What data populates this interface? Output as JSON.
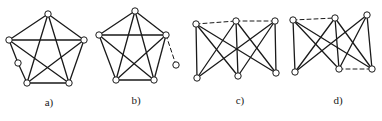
{
  "figure": {
    "colors": {
      "line": "#1a1a1a",
      "node_fill": "#ffffff",
      "background": "#ffffff"
    },
    "panels": [
      {
        "id": "a",
        "label": "a)",
        "label_pos": [
          49,
          104
        ],
        "nodes": [
          {
            "id": "top",
            "x": 48,
            "y": 14
          },
          {
            "id": "left",
            "x": 9,
            "y": 40
          },
          {
            "id": "right",
            "x": 84,
            "y": 40
          },
          {
            "id": "bottom-left",
            "x": 27,
            "y": 83
          },
          {
            "id": "bottom-right",
            "x": 69,
            "y": 83
          },
          {
            "id": "subdivision",
            "x": 18,
            "y": 63
          }
        ],
        "edges": [
          {
            "from": "top",
            "to": "left",
            "style": "solid"
          },
          {
            "from": "top",
            "to": "right",
            "style": "solid"
          },
          {
            "from": "top",
            "to": "bottom-left",
            "style": "solid"
          },
          {
            "from": "top",
            "to": "bottom-right",
            "style": "solid"
          },
          {
            "from": "left",
            "to": "right",
            "style": "solid"
          },
          {
            "from": "left",
            "to": "subdivision",
            "style": "solid"
          },
          {
            "from": "subdivision",
            "to": "bottom-left",
            "style": "solid"
          },
          {
            "from": "left",
            "to": "bottom-right",
            "style": "solid"
          },
          {
            "from": "right",
            "to": "bottom-left",
            "style": "solid"
          },
          {
            "from": "right",
            "to": "bottom-right",
            "style": "solid"
          },
          {
            "from": "bottom-left",
            "to": "bottom-right",
            "style": "solid"
          }
        ]
      },
      {
        "id": "b",
        "label": "b)",
        "label_pos": [
          136,
          102
        ],
        "nodes": [
          {
            "id": "top",
            "x": 135,
            "y": 11
          },
          {
            "id": "left",
            "x": 99,
            "y": 35
          },
          {
            "id": "right",
            "x": 166,
            "y": 35
          },
          {
            "id": "bottom-left",
            "x": 116,
            "y": 80
          },
          {
            "id": "bottom-right",
            "x": 154,
            "y": 80
          },
          {
            "id": "pendant",
            "x": 176,
            "y": 65
          }
        ],
        "edges": [
          {
            "from": "top",
            "to": "left",
            "style": "solid"
          },
          {
            "from": "top",
            "to": "right",
            "style": "solid"
          },
          {
            "from": "top",
            "to": "bottom-left",
            "style": "solid"
          },
          {
            "from": "top",
            "to": "bottom-right",
            "style": "solid"
          },
          {
            "from": "left",
            "to": "right",
            "style": "solid"
          },
          {
            "from": "left",
            "to": "bottom-left",
            "style": "solid"
          },
          {
            "from": "left",
            "to": "bottom-right",
            "style": "solid"
          },
          {
            "from": "right",
            "to": "bottom-left",
            "style": "solid"
          },
          {
            "from": "right",
            "to": "bottom-right",
            "style": "solid"
          },
          {
            "from": "bottom-left",
            "to": "bottom-right",
            "style": "solid"
          },
          {
            "from": "right",
            "to": "pendant",
            "style": "dashed"
          }
        ]
      },
      {
        "id": "c",
        "label": "c)",
        "label_pos": [
          240,
          102
        ],
        "nodes": [
          {
            "id": "top-left",
            "x": 196,
            "y": 24
          },
          {
            "id": "top-mid",
            "x": 236,
            "y": 21
          },
          {
            "id": "top-right",
            "x": 275,
            "y": 21
          },
          {
            "id": "bottom-left",
            "x": 197,
            "y": 78
          },
          {
            "id": "bottom-mid",
            "x": 238,
            "y": 76
          },
          {
            "id": "bottom-right",
            "x": 276,
            "y": 73
          }
        ],
        "edges": [
          {
            "from": "top-left",
            "to": "bottom-left",
            "style": "solid"
          },
          {
            "from": "top-left",
            "to": "bottom-mid",
            "style": "solid"
          },
          {
            "from": "top-left",
            "to": "bottom-right",
            "style": "solid"
          },
          {
            "from": "top-mid",
            "to": "bottom-left",
            "style": "solid"
          },
          {
            "from": "top-mid",
            "to": "bottom-mid",
            "style": "solid"
          },
          {
            "from": "top-mid",
            "to": "bottom-right",
            "style": "solid"
          },
          {
            "from": "top-right",
            "to": "bottom-left",
            "style": "solid"
          },
          {
            "from": "top-right",
            "to": "bottom-mid",
            "style": "solid"
          },
          {
            "from": "top-right",
            "to": "bottom-right",
            "style": "solid"
          },
          {
            "from": "top-left",
            "to": "top-mid",
            "style": "dashed"
          },
          {
            "from": "top-mid",
            "to": "top-right",
            "style": "dashed"
          }
        ]
      },
      {
        "id": "d",
        "label": "d)",
        "label_pos": [
          338,
          102
        ],
        "nodes": [
          {
            "id": "top-left",
            "x": 293,
            "y": 20
          },
          {
            "id": "top-mid",
            "x": 335,
            "y": 18
          },
          {
            "id": "top-right",
            "x": 367,
            "y": 15
          },
          {
            "id": "bottom-left",
            "x": 295,
            "y": 72
          },
          {
            "id": "bottom-mid",
            "x": 339,
            "y": 69
          },
          {
            "id": "bottom-right",
            "x": 372,
            "y": 69
          }
        ],
        "edges": [
          {
            "from": "top-left",
            "to": "bottom-left",
            "style": "solid"
          },
          {
            "from": "top-left",
            "to": "bottom-mid",
            "style": "solid"
          },
          {
            "from": "top-left",
            "to": "bottom-right",
            "style": "solid"
          },
          {
            "from": "top-mid",
            "to": "bottom-left",
            "style": "solid"
          },
          {
            "from": "top-mid",
            "to": "bottom-mid",
            "style": "solid"
          },
          {
            "from": "top-mid",
            "to": "bottom-right",
            "style": "solid"
          },
          {
            "from": "top-right",
            "to": "bottom-left",
            "style": "solid"
          },
          {
            "from": "top-right",
            "to": "bottom-mid",
            "style": "solid"
          },
          {
            "from": "top-right",
            "to": "bottom-right",
            "style": "solid"
          },
          {
            "from": "top-left",
            "to": "top-mid",
            "style": "dashed"
          },
          {
            "from": "bottom-mid",
            "to": "bottom-right",
            "style": "dashed"
          }
        ]
      }
    ],
    "node_radius": 3.2
  }
}
